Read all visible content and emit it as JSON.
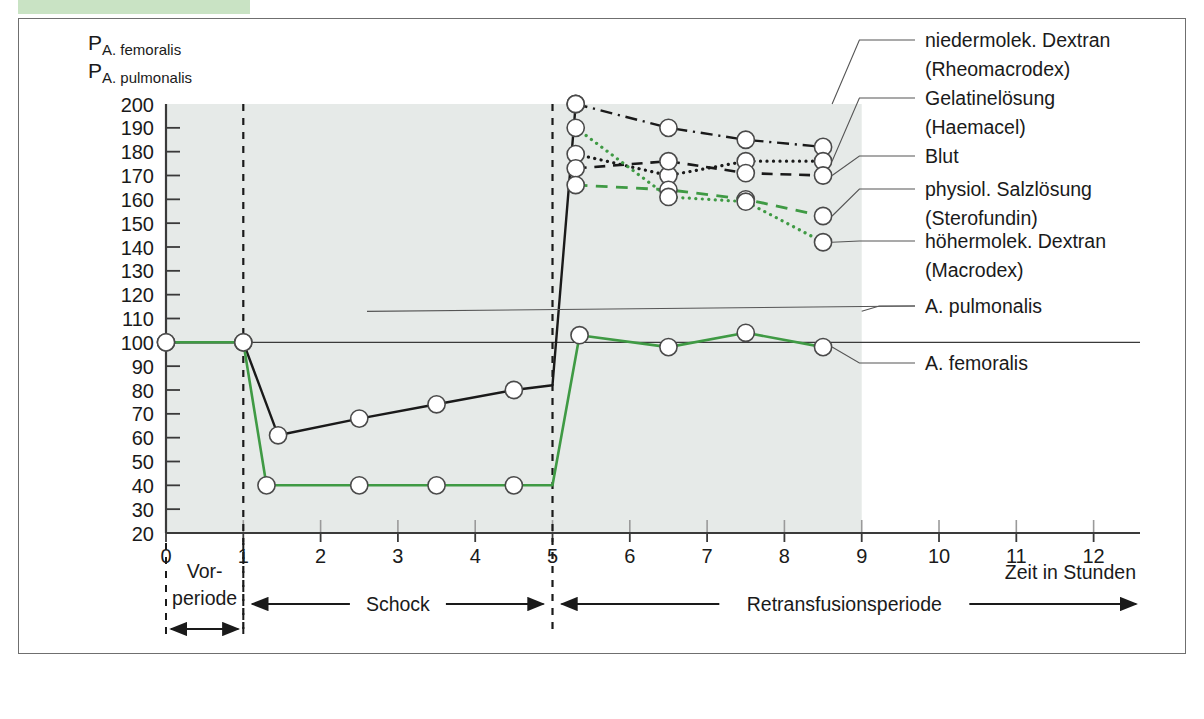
{
  "chart_data": {
    "type": "line",
    "title": "",
    "xlabel": "Zeit in Stunden",
    "ylabel_lines": [
      {
        "main": "P",
        "sub": "A. femoralis"
      },
      {
        "main": "P",
        "sub": "A. pulmonalis"
      }
    ],
    "xlim": [
      0,
      12.6
    ],
    "ylim": [
      20,
      200
    ],
    "xticks": [
      0,
      1,
      2,
      3,
      4,
      5,
      6,
      7,
      8,
      9,
      10,
      11,
      12
    ],
    "xticklabels": [
      "0",
      "1",
      "2",
      "3",
      "4",
      "5",
      "6",
      "7",
      "8",
      "9",
      "10",
      "11",
      "12"
    ],
    "yticks": [
      20,
      30,
      40,
      50,
      60,
      70,
      80,
      90,
      100,
      110,
      120,
      130,
      140,
      150,
      160,
      170,
      180,
      190,
      200
    ],
    "yticklabels": [
      "20",
      "30",
      "40",
      "50",
      "60",
      "70",
      "80",
      "90",
      "100",
      "110",
      "120",
      "130",
      "140",
      "150",
      "160",
      "170",
      "180",
      "190",
      "200"
    ],
    "grid": false,
    "legend_position": "right-outside",
    "shaded_region": {
      "x_from": 0,
      "x_to": 9,
      "color": "#e6eae8"
    },
    "reference_line": {
      "value": 100,
      "label": "A. femoralis baseline",
      "color": "#3a3a3a"
    },
    "dividers": [
      {
        "x": 1,
        "style": "dashed"
      },
      {
        "x": 5,
        "style": "dashed"
      }
    ],
    "series": [
      {
        "name": "A. femoralis",
        "color": "#1a1a1a",
        "style": "solid",
        "width": 2.4,
        "markers": true,
        "points": [
          {
            "x": 0,
            "y": 100
          },
          {
            "x": 1,
            "y": 100
          },
          {
            "x": 1.45,
            "y": 61
          },
          {
            "x": 2.5,
            "y": 68
          },
          {
            "x": 3.5,
            "y": 74
          },
          {
            "x": 4.5,
            "y": 80
          },
          {
            "x": 5.0,
            "y": 82
          },
          {
            "x": 5.3,
            "y": 200
          }
        ]
      },
      {
        "name": "A. pulmonalis",
        "color": "#3f9a44",
        "style": "solid",
        "width": 2.6,
        "markers": true,
        "points": [
          {
            "x": 0,
            "y": 100
          },
          {
            "x": 1,
            "y": 100
          },
          {
            "x": 1.3,
            "y": 40
          },
          {
            "x": 2.5,
            "y": 40
          },
          {
            "x": 3.5,
            "y": 40
          },
          {
            "x": 4.5,
            "y": 40
          },
          {
            "x": 5.0,
            "y": 40
          },
          {
            "x": 5.35,
            "y": 103
          },
          {
            "x": 6.5,
            "y": 98
          },
          {
            "x": 7.5,
            "y": 104
          },
          {
            "x": 8.5,
            "y": 98
          }
        ]
      },
      {
        "name": "niedermolek. Dextran (Rheomacrodex)",
        "color": "#1a1a1a",
        "style": "dashdot",
        "width": 2.4,
        "markers": true,
        "points": [
          {
            "x": 5.3,
            "y": 200
          },
          {
            "x": 6.5,
            "y": 190
          },
          {
            "x": 7.5,
            "y": 185
          },
          {
            "x": 8.5,
            "y": 182
          }
        ]
      },
      {
        "name": "Gelatinelösung (Haemacel)",
        "color": "#1a1a1a",
        "style": "dotted",
        "width": 3.2,
        "markers": true,
        "points": [
          {
            "x": 5.3,
            "y": 179
          },
          {
            "x": 6.5,
            "y": 170
          },
          {
            "x": 7.5,
            "y": 176
          },
          {
            "x": 8.5,
            "y": 176
          }
        ]
      },
      {
        "name": "Blut",
        "color": "#1a1a1a",
        "style": "dashed",
        "width": 2.6,
        "markers": true,
        "points": [
          {
            "x": 5.3,
            "y": 173
          },
          {
            "x": 6.5,
            "y": 176
          },
          {
            "x": 7.5,
            "y": 171
          },
          {
            "x": 8.5,
            "y": 170
          }
        ]
      },
      {
        "name": "physiol. Salzlösung (Sterofundin)",
        "color": "#3f9a44",
        "style": "dashed",
        "width": 2.8,
        "markers": true,
        "points": [
          {
            "x": 5.3,
            "y": 166
          },
          {
            "x": 6.5,
            "y": 164
          },
          {
            "x": 7.5,
            "y": 160
          },
          {
            "x": 8.5,
            "y": 153
          }
        ]
      },
      {
        "name": "höhermolek. Dextran (Macrodex)",
        "color": "#3f9a44",
        "style": "dotted",
        "width": 3.2,
        "markers": true,
        "points": [
          {
            "x": 5.3,
            "y": 190
          },
          {
            "x": 6.5,
            "y": 161
          },
          {
            "x": 7.5,
            "y": 159
          },
          {
            "x": 8.5,
            "y": 142
          }
        ]
      }
    ],
    "legend_entries": [
      {
        "label_lines": [
          "niedermolek. Dextran",
          "(Rheomacrodex)"
        ],
        "anchor_y": 200
      },
      {
        "label_lines": [
          "Gelatinelösung",
          "(Haemacel)"
        ],
        "anchor_y": 176
      },
      {
        "label_lines": [
          "Blut"
        ],
        "anchor_y": 170
      },
      {
        "label_lines": [
          "physiol. Salzlösung",
          "(Sterofundin)"
        ],
        "anchor_y": 153
      },
      {
        "label_lines": [
          "höhermolek. Dextran",
          "(Macrodex)"
        ],
        "anchor_y": 142
      },
      {
        "label_lines": [
          "A. pulmonalis"
        ],
        "anchor_y": 103
      },
      {
        "label_lines": [
          "A. femoralis"
        ],
        "anchor_y": 98
      }
    ],
    "period_annotations": [
      {
        "label_lines": [
          "Vor-",
          "periode"
        ],
        "x_from": 0,
        "x_to": 1
      },
      {
        "label_lines": [
          "Schock"
        ],
        "x_from": 1,
        "x_to": 5
      },
      {
        "label_lines": [
          "Retransfusionsperiode"
        ],
        "x_from": 5,
        "x_to": 12.55
      }
    ]
  },
  "colors": {
    "green_accent": "#3f9a44",
    "banner_green": "#c9e3c4",
    "plot_shade": "#e6eae8",
    "ink": "#1a1a1a",
    "frame": "#6f6f6f"
  }
}
